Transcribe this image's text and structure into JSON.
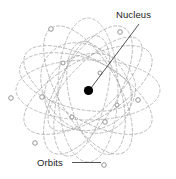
{
  "figure": {
    "background_color": "#ffffff",
    "width": 176,
    "height": 179
  },
  "labels": {
    "nucleus": "Nucleus",
    "orbits": "Orbits"
  },
  "colors": {
    "nucleus_fill": "#000000",
    "orbit_stroke": "#9a9a9a",
    "electron_stroke": "#8a8a8a",
    "electron_fill": "#ffffff",
    "leader_line": "#2a2a2a",
    "text": "#1b1b1b"
  },
  "nucleus": {
    "cx": 88.5,
    "cy": 90.5,
    "r": 4.6
  },
  "leader_lines": [
    {
      "name": "nucleus-leader",
      "x1": 139,
      "y1": 24,
      "x2": 91,
      "y2": 88
    },
    {
      "name": "orbits-leader",
      "x1": 72,
      "y1": 162.5,
      "x2": 101,
      "y2": 162.5
    }
  ],
  "orbits": {
    "count": 12,
    "description": "Overlapping dashed elliptical electron orbits around a central nucleus",
    "ellipses": [
      {
        "cx": 88,
        "cy": 90,
        "rx": 72,
        "ry": 30,
        "rot": 0
      },
      {
        "cx": 88,
        "cy": 90,
        "rx": 72,
        "ry": 30,
        "rot": 30
      },
      {
        "cx": 88,
        "cy": 90,
        "rx": 72,
        "ry": 30,
        "rot": 60
      },
      {
        "cx": 88,
        "cy": 90,
        "rx": 72,
        "ry": 30,
        "rot": 90
      },
      {
        "cx": 88,
        "cy": 90,
        "rx": 72,
        "ry": 30,
        "rot": 120
      },
      {
        "cx": 88,
        "cy": 90,
        "rx": 72,
        "ry": 30,
        "rot": 150
      },
      {
        "cx": 76,
        "cy": 82,
        "rx": 58,
        "ry": 26,
        "rot": 15
      },
      {
        "cx": 96,
        "cy": 98,
        "rx": 58,
        "ry": 26,
        "rot": 75
      },
      {
        "cx": 82,
        "cy": 96,
        "rx": 62,
        "ry": 24,
        "rot": 105
      },
      {
        "cx": 95,
        "cy": 84,
        "rx": 62,
        "ry": 24,
        "rot": 135
      },
      {
        "cx": 86,
        "cy": 88,
        "rx": 50,
        "ry": 40,
        "rot": 45
      },
      {
        "cx": 90,
        "cy": 92,
        "rx": 46,
        "ry": 38,
        "rot": 165
      }
    ]
  },
  "electrons": [
    {
      "cx": 51,
      "cy": 29,
      "r": 2.3
    },
    {
      "cx": 120,
      "cy": 32,
      "r": 2.3
    },
    {
      "cx": 11,
      "cy": 98,
      "r": 2.3
    },
    {
      "cx": 42,
      "cy": 97,
      "r": 2.3
    },
    {
      "cx": 138,
      "cy": 100,
      "r": 2.3
    },
    {
      "cx": 105,
      "cy": 122,
      "r": 2.3
    },
    {
      "cx": 35,
      "cy": 143,
      "r": 2.3
    },
    {
      "cx": 104,
      "cy": 165,
      "r": 2.3
    },
    {
      "cx": 100,
      "cy": 73,
      "r": 2.0
    },
    {
      "cx": 63,
      "cy": 63,
      "r": 2.0
    },
    {
      "cx": 117,
      "cy": 105,
      "r": 2.0
    },
    {
      "cx": 72,
      "cy": 117,
      "r": 2.0
    }
  ]
}
